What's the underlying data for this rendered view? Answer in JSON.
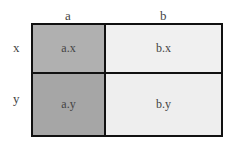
{
  "columns": [
    {
      "label": "a"
    },
    {
      "label": "b"
    }
  ],
  "rows": [
    {
      "label": "x"
    },
    {
      "label": "y"
    }
  ],
  "cells": {
    "ax": {
      "label": "a.x",
      "color": "#b0b0b0"
    },
    "bx": {
      "label": "b.x",
      "color": "#f0f0f0"
    },
    "ay": {
      "label": "a.y",
      "color": "#a6a6a6"
    },
    "by": {
      "label": "b.y",
      "color": "#eeeeee"
    }
  }
}
